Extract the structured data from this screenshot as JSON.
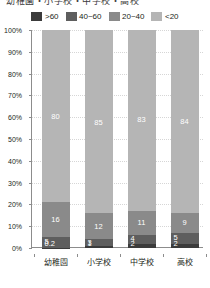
{
  "title": {
    "text": "幼稚園・小学校・中学校・高校"
  },
  "legend": {
    "items": [
      {
        "label": ">60",
        "color": "#3b3b3b"
      },
      {
        "label": "40~60",
        "color": "#5e5e5e"
      },
      {
        "label": "20~40",
        "color": "#8a8a8a"
      },
      {
        "label": "<20",
        "color": "#b5b5b5"
      }
    ]
  },
  "yaxis": {
    "ticks": [
      "100%",
      "90%",
      "80%",
      "70%",
      "60%",
      "50%",
      "40%",
      "30%",
      "20%",
      "10%",
      "0%"
    ]
  },
  "chart_data": {
    "type": "bar",
    "stacked": true,
    "stack_total_percent": 100,
    "title": "幼稚園・小学校・中学校・高校",
    "xlabel": "",
    "ylabel": "",
    "ylim": [
      0,
      100
    ],
    "ytick_values": [
      0,
      10,
      20,
      30,
      40,
      50,
      60,
      70,
      80,
      90,
      100
    ],
    "ytick_labels": [
      "0%",
      "10%",
      "20%",
      "30%",
      "40%",
      "50%",
      "60%",
      "70%",
      "80%",
      "90%",
      "100%"
    ],
    "grid": true,
    "legend_position": "top",
    "categories": [
      "幼稚園",
      "小学校",
      "中学校",
      "高校"
    ],
    "series": [
      {
        "name": ">60",
        "color": "#3b3b3b",
        "values": [
          0.2,
          1,
          2,
          2
        ],
        "labels": [
          "0.2",
          "1",
          "2",
          "2"
        ]
      },
      {
        "name": "40~60",
        "color": "#5e5e5e",
        "values": [
          5,
          3,
          4,
          5
        ],
        "labels": [
          "5",
          "3",
          "4",
          "5"
        ]
      },
      {
        "name": "20~40",
        "color": "#8a8a8a",
        "values": [
          16,
          12,
          11,
          9
        ],
        "labels": [
          "16",
          "12",
          "11",
          "9"
        ]
      },
      {
        "name": "<20",
        "color": "#b5b5b5",
        "values": [
          80,
          85,
          83,
          84
        ],
        "labels": [
          "80",
          "85",
          "83",
          "84"
        ]
      }
    ]
  }
}
